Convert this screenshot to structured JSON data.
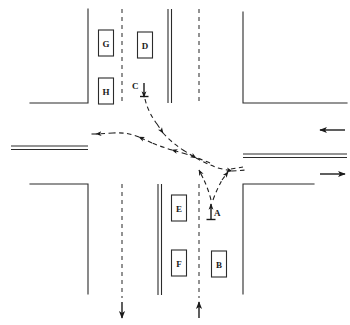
{
  "diagram": {
    "type": "traffic-intersection-schematic",
    "background_color": "#ffffff",
    "line_color": "#2b2b2b",
    "trajectory_color": "#1f1f1f",
    "width": 350,
    "height": 325
  },
  "vehicles": [
    {
      "id": "A",
      "label": "A",
      "x": 213,
      "y": 213,
      "kind": "point-label",
      "heading": "north",
      "note": "turning vehicle at stop line, northbound"
    },
    {
      "id": "B",
      "label": "B",
      "x": 219,
      "y": 264,
      "kind": "box",
      "heading": "north",
      "note": "queued northbound"
    },
    {
      "id": "C",
      "label": "C",
      "x": 141,
      "y": 89,
      "kind": "point-label",
      "heading": "south",
      "note": "southbound vehicle approaching"
    },
    {
      "id": "D",
      "label": "D",
      "x": 145,
      "y": 45,
      "kind": "box",
      "heading": "south",
      "note": "queued southbound"
    },
    {
      "id": "E",
      "label": "E",
      "x": 179,
      "y": 208,
      "kind": "box",
      "heading": "north",
      "note": "queued, inner lane"
    },
    {
      "id": "F",
      "label": "F",
      "x": 179,
      "y": 263,
      "kind": "box",
      "heading": "north",
      "note": "queued, inner lane"
    },
    {
      "id": "G",
      "label": "G",
      "x": 106,
      "y": 43,
      "kind": "box",
      "heading": "south",
      "note": "queued southbound outer lane"
    },
    {
      "id": "H",
      "label": "H",
      "x": 106,
      "y": 91,
      "kind": "box",
      "heading": "south",
      "note": "queued southbound outer lane"
    }
  ],
  "box_size": {
    "w": 15,
    "h": 26
  },
  "roads": {
    "vertical": {
      "orientation": "vertical",
      "left_edge_x": 88,
      "right_edge_x": 243,
      "center_double_x": [
        168,
        171
      ],
      "lane_dashes_x": [
        122,
        199
      ],
      "arrows_bottom": [
        {
          "name": "southbound-outflow",
          "x": 122,
          "direction": "down",
          "y_from": 300,
          "y_to": 318
        },
        {
          "name": "northbound-inflow",
          "x": 199,
          "direction": "up",
          "y_from": 318,
          "y_to": 300
        }
      ]
    },
    "horizontal": {
      "orientation": "horizontal",
      "top_edge_y": 103,
      "bottom_edge_y": 184,
      "center_double_y": [
        146,
        149
      ],
      "arrows_right": [
        {
          "name": "westbound-inflow",
          "y": 130,
          "direction": "left",
          "x_from": 345,
          "x_to": 320
        },
        {
          "name": "eastbound-outflow",
          "y": 174,
          "direction": "right",
          "x_from": 320,
          "x_to": 345
        }
      ]
    }
  },
  "trajectories": [
    {
      "name": "vehicle-C-left-turn-path",
      "description": "Southbound vehicle C turns, crossing the intersection and departing westbound",
      "style": "dashed-with-arrowheads",
      "arrowheads": [
        "mid-upper",
        "mid",
        "mid-lower",
        "terminal-west"
      ]
    },
    {
      "name": "vehicle-A-left-turn-path",
      "description": "Northbound vehicle A turns left, path splits toward east exit and toward west exit",
      "style": "dashed-with-arrowheads",
      "arrowheads": [
        "east-exit",
        "west-bound-merge"
      ]
    }
  ],
  "labels": {
    "A": "A",
    "B": "B",
    "C": "C",
    "D": "D",
    "E": "E",
    "F": "F",
    "G": "G",
    "H": "H"
  }
}
